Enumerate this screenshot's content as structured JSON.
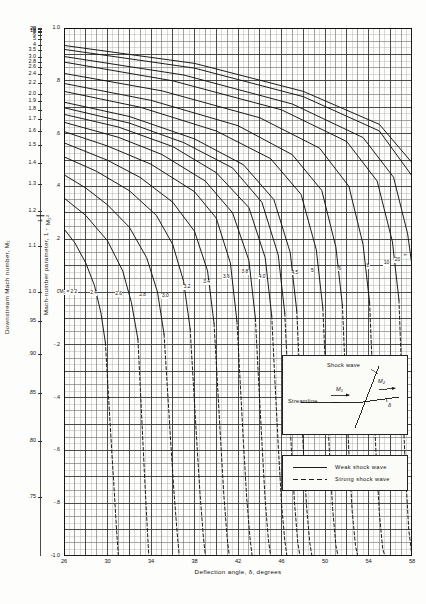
{
  "figure": {
    "kind": "oblique-shock-chart",
    "x_axis": {
      "title": "Deflection angle, δ, degrees",
      "min": 26,
      "max": 58,
      "major_step": 4,
      "minor_step": 0.5,
      "tick_labels": [
        "26",
        "30",
        "34",
        "38",
        "42",
        "46",
        "50",
        "54",
        "58"
      ],
      "tick_values": [
        26,
        30,
        34,
        38,
        42,
        46,
        50,
        54,
        58
      ]
    },
    "y_axis_parameter": {
      "title_pre": "Mach-number parameter, 1 -",
      "title_num": "1",
      "title_den": "M₂²",
      "min": -1.0,
      "max": 1.0,
      "major_step": 0.2,
      "minor_step": 0.025,
      "tick_labels": [
        "1.0",
        ".8",
        ".6",
        ".4",
        ".2",
        "0",
        "-.2",
        "-.4",
        "-.6",
        "-.8",
        "-1.0"
      ],
      "tick_values": [
        1.0,
        0.8,
        0.6,
        0.4,
        0.2,
        0.0,
        -0.2,
        -0.4,
        -0.6,
        -0.8,
        -1.0
      ]
    },
    "y_axis_mach": {
      "title": "Downstream  Mach number,",
      "title_sym": "M₂",
      "tick_labels": [
        "∞",
        "20",
        "10",
        "8",
        "6",
        "5",
        "4",
        "3.5",
        "3.0",
        "2.8",
        "2.6",
        "2.4",
        "2.2",
        "2.0",
        "1.9",
        "1.8",
        "1.7",
        "1.6",
        "1.5",
        "1.4",
        "1.3",
        "1.2",
        "1.1",
        "1.0",
        ".95",
        ".90",
        ".85",
        ".80",
        ".75",
        ".70",
        ".65",
        ".60",
        ".55",
        ".50"
      ],
      "tick_param_values": [
        1.0,
        0.9975,
        0.99,
        0.984375,
        0.97222,
        0.96,
        0.9375,
        0.918367,
        0.888889,
        0.872449,
        0.852071,
        0.826389,
        0.793388,
        0.75,
        0.722992,
        0.691358,
        0.653979,
        0.609375,
        0.555556,
        0.489796,
        0.408284,
        0.305556,
        0.173554,
        0.0,
        -0.108033,
        -0.234568,
        -0.384083,
        -0.5625,
        -0.777778,
        -1.040816,
        -1.366864,
        -1.777778,
        -2.305785,
        -3.0
      ]
    },
    "curve_labels": {
      "prefix": "M₁ =",
      "values": [
        "2.2",
        "2.4",
        "2.6",
        "2.8",
        "3.0",
        "3.2",
        "3.4",
        "3.6",
        "3.8",
        "4.0",
        "4.5",
        "5",
        "6",
        "8",
        "10",
        "20",
        "∞"
      ]
    },
    "legend": {
      "weak": "Weak shock wave",
      "strong": "Strong shock wave"
    },
    "inset": {
      "shock_label": "Shock wave",
      "streamline_label": "Streamline",
      "m1": "M₁",
      "m2": "M₂",
      "delta": "δ"
    },
    "colors": {
      "grid_minor": "#9a9a9a",
      "grid_major": "#2f2f2f",
      "curve": "#111111",
      "paper": "#fdfdfb"
    }
  },
  "chart_data": {
    "type": "line",
    "title": "",
    "xlabel": "Deflection angle, δ, degrees",
    "ylabel": "Mach-number parameter, 1 - 1/M₂²",
    "ylabel_secondary": "Downstream Mach number, M₂",
    "xlim": [
      26,
      58
    ],
    "ylim": [
      -1.0,
      1.0
    ],
    "grid": true,
    "legend_position": "inside-bottom-right",
    "legend": [
      "Weak shock wave",
      "Strong shock wave"
    ],
    "series": [
      {
        "name": "M1 = 2.2",
        "style": "weak",
        "x": [
          26.0,
          27.0,
          28.0,
          28.8,
          29.4,
          29.8
        ],
        "y": [
          0.239,
          0.186,
          0.11,
          0.025,
          -0.08,
          -0.19
        ]
      },
      {
        "name": "M1 = 2.2s",
        "style": "strong",
        "x": [
          29.8,
          30.0,
          30.2,
          30.4,
          30.6,
          30.8,
          31.0
        ],
        "y": [
          -0.19,
          -0.33,
          -0.47,
          -0.61,
          -0.74,
          -0.88,
          -1.0
        ]
      },
      {
        "name": "M1 = 2.4",
        "style": "weak",
        "x": [
          26.0,
          28.0,
          30.0,
          31.4,
          32.2,
          32.8
        ],
        "y": [
          0.356,
          0.29,
          0.194,
          0.08,
          -0.04,
          -0.18
        ]
      },
      {
        "name": "M1 = 2.4s",
        "style": "strong",
        "x": [
          32.8,
          33.0,
          33.2,
          33.4,
          33.6,
          33.8
        ],
        "y": [
          -0.18,
          -0.35,
          -0.52,
          -0.69,
          -0.85,
          -1.0
        ]
      },
      {
        "name": "M1 = 2.6",
        "style": "weak",
        "x": [
          26.0,
          28.0,
          30.0,
          32.0,
          33.6,
          34.6,
          35.2
        ],
        "y": [
          0.444,
          0.394,
          0.33,
          0.246,
          0.13,
          0.0,
          -0.16
        ]
      },
      {
        "name": "M1 = 2.6s",
        "style": "strong",
        "x": [
          35.2,
          35.5,
          35.8,
          36.1,
          36.4,
          36.6
        ],
        "y": [
          -0.16,
          -0.36,
          -0.56,
          -0.75,
          -0.91,
          -1.0
        ]
      },
      {
        "name": "M1 = 2.8",
        "style": "weak",
        "x": [
          26.0,
          29.0,
          32.0,
          34.5,
          36.0,
          37.0,
          37.6
        ],
        "y": [
          0.512,
          0.457,
          0.384,
          0.29,
          0.18,
          0.04,
          -0.14
        ]
      },
      {
        "name": "M1 = 2.8s",
        "style": "strong",
        "x": [
          37.6,
          37.9,
          38.2,
          38.5,
          38.8,
          39.0
        ],
        "y": [
          -0.14,
          -0.35,
          -0.56,
          -0.76,
          -0.92,
          -1.0
        ]
      },
      {
        "name": "M1 = 3.0",
        "style": "weak",
        "x": [
          26.0,
          30.0,
          33.0,
          36.0,
          38.0,
          39.2,
          39.8
        ],
        "y": [
          0.565,
          0.499,
          0.434,
          0.34,
          0.23,
          0.08,
          -0.12
        ]
      },
      {
        "name": "M1 = 3.0s",
        "style": "strong",
        "x": [
          39.8,
          40.1,
          40.4,
          40.7,
          41.0,
          41.2
        ],
        "y": [
          -0.12,
          -0.34,
          -0.56,
          -0.77,
          -0.93,
          -1.0
        ]
      },
      {
        "name": "M1 = 3.2",
        "style": "weak",
        "x": [
          26.0,
          30.0,
          34.0,
          38.0,
          40.0,
          41.3,
          41.9
        ],
        "y": [
          0.608,
          0.553,
          0.484,
          0.38,
          0.28,
          0.11,
          -0.11
        ]
      },
      {
        "name": "M1 = 3.2s",
        "style": "strong",
        "x": [
          41.9,
          42.2,
          42.5,
          42.8,
          43.1,
          43.3
        ],
        "y": [
          -0.11,
          -0.34,
          -0.57,
          -0.78,
          -0.93,
          -1.0
        ]
      },
      {
        "name": "M1 = 3.4",
        "style": "weak",
        "x": [
          26.0,
          31.0,
          35.0,
          39.0,
          41.5,
          43.0,
          43.6
        ],
        "y": [
          0.643,
          0.586,
          0.521,
          0.42,
          0.3,
          0.12,
          -0.1
        ]
      },
      {
        "name": "M1 = 3.4s",
        "style": "strong",
        "x": [
          43.6,
          43.9,
          44.2,
          44.5,
          44.8,
          45.0
        ],
        "y": [
          -0.1,
          -0.34,
          -0.57,
          -0.79,
          -0.94,
          -1.0
        ]
      },
      {
        "name": "M1 = 3.6",
        "style": "weak",
        "x": [
          26.0,
          31.0,
          36.0,
          40.0,
          43.0,
          44.5,
          45.1
        ],
        "y": [
          0.673,
          0.625,
          0.551,
          0.452,
          0.32,
          0.13,
          -0.09
        ]
      },
      {
        "name": "M1 = 3.6s",
        "style": "strong",
        "x": [
          45.1,
          45.4,
          45.7,
          46.0,
          46.3,
          46.5
        ],
        "y": [
          -0.09,
          -0.34,
          -0.58,
          -0.8,
          -0.94,
          -1.0
        ]
      },
      {
        "name": "M1 = 3.8",
        "style": "weak",
        "x": [
          26.0,
          32.0,
          37.0,
          41.5,
          44.2,
          45.7,
          46.3
        ],
        "y": [
          0.698,
          0.64,
          0.566,
          0.47,
          0.34,
          0.14,
          -0.08
        ]
      },
      {
        "name": "M1 = 3.8s",
        "style": "strong",
        "x": [
          46.3,
          46.6,
          46.9,
          47.2,
          47.5,
          47.7
        ],
        "y": [
          -0.08,
          -0.34,
          -0.59,
          -0.8,
          -0.95,
          -1.0
        ]
      },
      {
        "name": "M1 = 4.0",
        "style": "weak",
        "x": [
          26.0,
          32.0,
          38.0,
          42.5,
          45.3,
          46.8,
          47.4
        ],
        "y": [
          0.719,
          0.665,
          0.58,
          0.482,
          0.35,
          0.15,
          -0.07
        ]
      },
      {
        "name": "M1 = 4.0s",
        "style": "strong",
        "x": [
          47.4,
          47.7,
          48.0,
          48.3,
          48.6,
          48.8
        ],
        "y": [
          -0.07,
          -0.34,
          -0.59,
          -0.81,
          -0.95,
          -1.0
        ]
      },
      {
        "name": "M1 = 4.5",
        "style": "weak",
        "x": [
          26.0,
          33.0,
          40.0,
          45.0,
          47.8,
          49.2,
          49.8
        ],
        "y": [
          0.76,
          0.7,
          0.61,
          0.505,
          0.37,
          0.16,
          -0.06
        ]
      },
      {
        "name": "M1 = 4.5s",
        "style": "strong",
        "x": [
          49.8,
          50.1,
          50.4,
          50.7,
          51.0,
          51.2
        ],
        "y": [
          -0.06,
          -0.34,
          -0.6,
          -0.82,
          -0.96,
          -1.0
        ]
      },
      {
        "name": "M1 = 5",
        "style": "weak",
        "x": [
          26.0,
          34.0,
          42.0,
          47.0,
          49.7,
          51.0,
          51.6
        ],
        "y": [
          0.79,
          0.726,
          0.63,
          0.52,
          0.385,
          0.17,
          -0.05
        ]
      },
      {
        "name": "M1 = 5s",
        "style": "strong",
        "x": [
          51.6,
          51.9,
          52.2,
          52.5,
          52.8,
          53.0
        ],
        "y": [
          -0.05,
          -0.34,
          -0.61,
          -0.83,
          -0.96,
          -1.0
        ]
      },
      {
        "name": "M1 = 6",
        "style": "weak",
        "x": [
          26.0,
          35.0,
          44.0,
          49.5,
          52.2,
          53.5,
          54.1
        ],
        "y": [
          0.828,
          0.762,
          0.66,
          0.545,
          0.4,
          0.18,
          -0.04
        ]
      },
      {
        "name": "M1 = 6s",
        "style": "strong",
        "x": [
          54.1,
          54.4,
          54.7,
          55.0,
          55.3,
          55.5
        ],
        "y": [
          -0.04,
          -0.34,
          -0.62,
          -0.84,
          -0.97,
          -1.0
        ]
      },
      {
        "name": "M1 = 8",
        "style": "weak",
        "x": [
          26.0,
          36.0,
          46.0,
          52.0,
          54.8,
          56.2,
          56.8
        ],
        "y": [
          0.871,
          0.8,
          0.69,
          0.57,
          0.42,
          0.19,
          -0.03
        ]
      },
      {
        "name": "M1 = 8s",
        "style": "strong",
        "x": [
          56.8,
          57.1,
          57.4,
          57.7,
          58.0
        ],
        "y": [
          -0.03,
          -0.37,
          -0.68,
          -0.9,
          -1.0
        ]
      },
      {
        "name": "M1 = 10",
        "style": "weak",
        "x": [
          26.0,
          37.0,
          47.0,
          53.5,
          56.3,
          57.6,
          58.0
        ],
        "y": [
          0.892,
          0.822,
          0.712,
          0.585,
          0.435,
          0.22,
          0.1
        ]
      },
      {
        "name": "M1 = 20",
        "style": "weak",
        "x": [
          26.0,
          38.0,
          48.0,
          55.0,
          58.0
        ],
        "y": [
          0.919,
          0.848,
          0.74,
          0.61,
          0.44
        ]
      },
      {
        "name": "M1 = inf",
        "style": "weak",
        "x": [
          26.0,
          38.0,
          48.0,
          55.0,
          58.0
        ],
        "y": [
          0.934,
          0.866,
          0.76,
          0.635,
          0.49
        ]
      }
    ]
  }
}
